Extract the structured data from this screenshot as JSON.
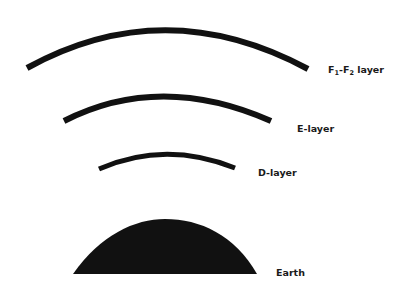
{
  "diagram": {
    "colors": {
      "ink": "#111111",
      "background": "#ffffff"
    },
    "layers": [
      {
        "id": "f",
        "label_main": "F",
        "sub1": "1",
        "dash": "-F",
        "sub2": "2",
        "suffix": " layer"
      },
      {
        "id": "e",
        "label": "E-layer"
      },
      {
        "id": "d",
        "label": "D-layer"
      }
    ],
    "earth": {
      "label": "Earth"
    }
  }
}
